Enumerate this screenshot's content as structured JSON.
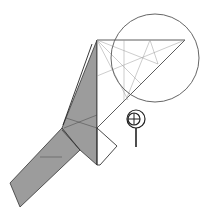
{
  "diagram": {
    "type": "origami-folding-step",
    "colors": {
      "paper_back": "#999999",
      "paper_front": "#ffffff",
      "edge": "#333333",
      "crease": "#9a9a9a",
      "circle": "#555555"
    },
    "symbols": [
      {
        "name": "zoom-in-magnifier",
        "meaning": "view detail enlarged"
      }
    ],
    "highlight_circle": {
      "cx": 155,
      "cy": 58,
      "r": 44
    }
  }
}
